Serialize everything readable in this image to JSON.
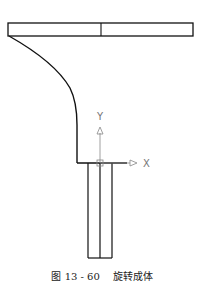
{
  "figure": {
    "caption_number": "图 13 - 60",
    "caption_title": "旋转成体",
    "axes": {
      "x_label": "X",
      "y_label": "Y"
    },
    "colors": {
      "outline": "#111111",
      "axis": "#888888",
      "background": "#ffffff"
    }
  }
}
